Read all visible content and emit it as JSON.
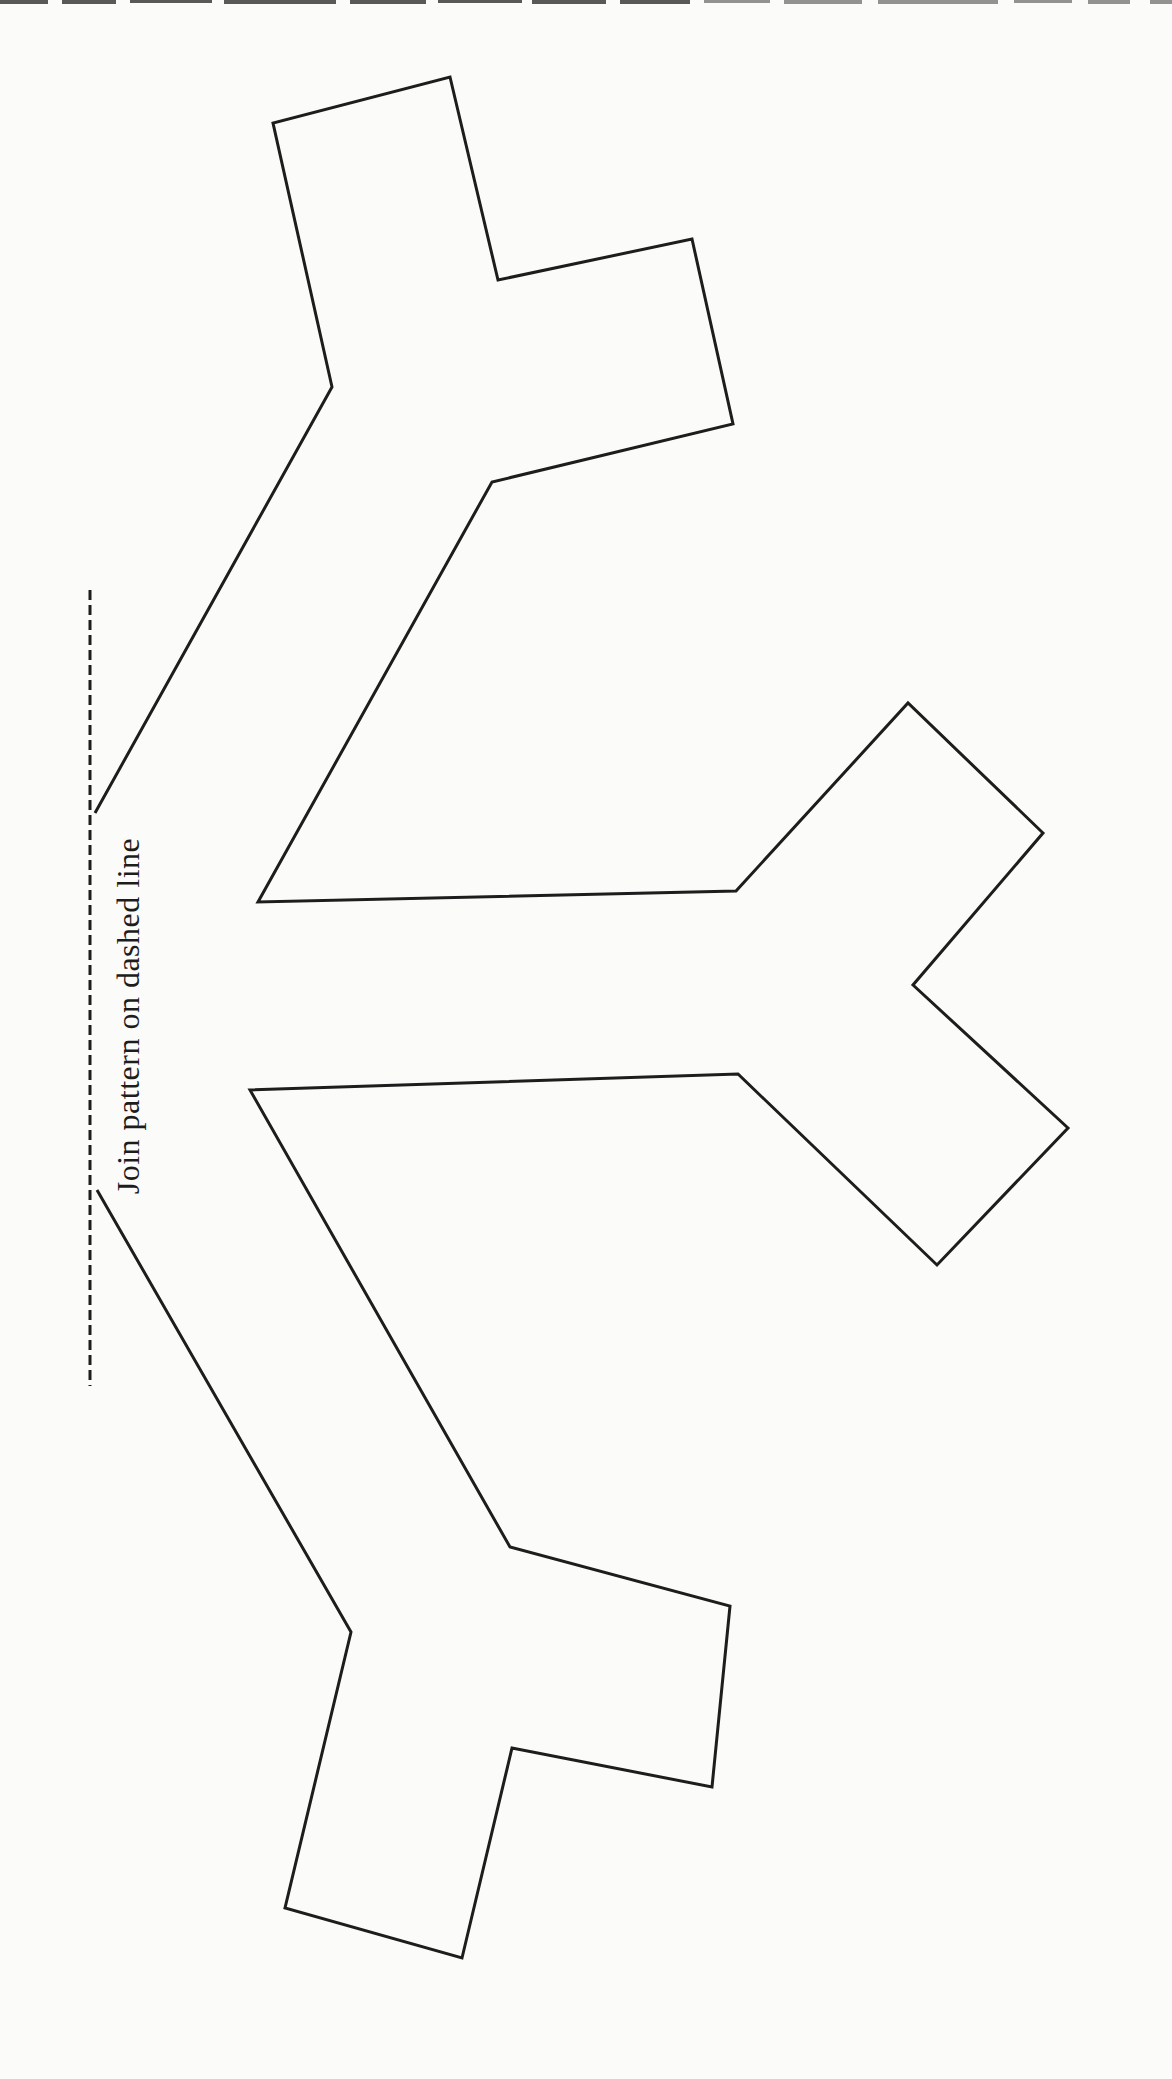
{
  "page": {
    "background": "#fbfbf9",
    "ink": "#1d1d1d",
    "width": 1172,
    "height": 2079
  },
  "instruction": {
    "label": "Join pattern on dashed line"
  },
  "pattern": {
    "type": "half-snowflake fold-and-cut template",
    "stroke_width": 3,
    "outline_points": [
      [
        95,
        813
      ],
      [
        332,
        387
      ],
      [
        273,
        123
      ],
      [
        450,
        77
      ],
      [
        498,
        280
      ],
      [
        692,
        239
      ],
      [
        733,
        424
      ],
      [
        492,
        482
      ],
      [
        258,
        902
      ],
      [
        736,
        891
      ],
      [
        908,
        703
      ],
      [
        1043,
        833
      ],
      [
        913,
        985
      ],
      [
        1068,
        1128
      ],
      [
        937,
        1265
      ],
      [
        738,
        1074
      ],
      [
        250,
        1090
      ],
      [
        510,
        1547
      ],
      [
        730,
        1606
      ],
      [
        712,
        1787
      ],
      [
        512,
        1748
      ],
      [
        462,
        1958
      ],
      [
        285,
        1908
      ],
      [
        351,
        1632
      ],
      [
        97,
        1190
      ]
    ],
    "fold_line": {
      "x": 90,
      "y1": 590,
      "y2": 1386,
      "dash": "10 5",
      "stroke_width": 3
    },
    "scan_edge": {
      "y": 0,
      "height": 4,
      "color": "#3c3c3c",
      "segments": [
        [
          0,
          48
        ],
        [
          62,
          54
        ],
        [
          130,
          82
        ],
        [
          224,
          112
        ],
        [
          350,
          76
        ],
        [
          438,
          84
        ],
        [
          532,
          74
        ],
        [
          620,
          70
        ],
        [
          704,
          66
        ],
        [
          784,
          78
        ],
        [
          878,
          120
        ],
        [
          1014,
          58
        ],
        [
          1088,
          42
        ],
        [
          1150,
          22
        ]
      ]
    }
  }
}
